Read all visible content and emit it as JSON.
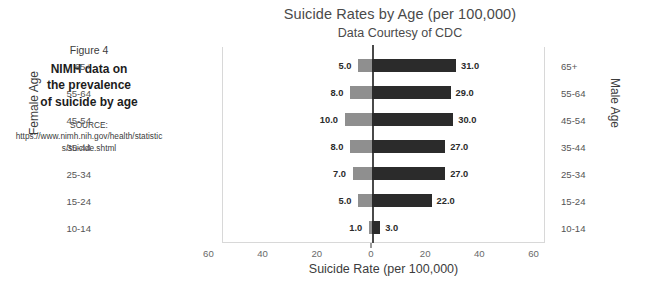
{
  "figure": {
    "number": "Figure 4",
    "headline_line1": "NIMH data on",
    "headline_line2": "the prevalence",
    "headline_line3": "of suicide by age",
    "source": "SOURCE: https://www.nimh.nih.gov/health/statistics/suicide.shtml"
  },
  "chart_data": {
    "type": "bar",
    "orientation": "horizontal-diverging",
    "title": "Suicide Rates by Age (per 100,000)",
    "subtitle": "Data Courtesy of CDC",
    "xlabel": "Suicide Rate (per 100,000)",
    "ylabel_left": "Female Age",
    "ylabel_right": "Male Age",
    "categories": [
      "65+",
      "55-64",
      "45-54",
      "35-44",
      "25-34",
      "15-24",
      "10-14"
    ],
    "series": [
      {
        "name": "Female",
        "side": "left",
        "color": "#8f8f8f",
        "values": [
          5.0,
          8.0,
          10.0,
          8.0,
          7.0,
          5.0,
          1.0
        ],
        "labels": [
          "5.0",
          "8.0",
          "10.0",
          "8.0",
          "7.0",
          "5.0",
          "1.0"
        ]
      },
      {
        "name": "Male",
        "side": "right",
        "color": "#2b2b2b",
        "values": [
          31.0,
          29.0,
          30.0,
          27.0,
          27.0,
          22.0,
          3.0
        ],
        "labels": [
          "31.0",
          "29.0",
          "30.0",
          "27.0",
          "27.0",
          "22.0",
          "3.0"
        ]
      }
    ],
    "xticks": [
      "60",
      "40",
      "20",
      "0",
      "20",
      "40",
      "60"
    ],
    "xtick_values": [
      -60,
      -40,
      -20,
      0,
      20,
      40,
      60
    ],
    "xlim": [
      -62,
      62
    ],
    "grid": false,
    "legend": "none"
  }
}
